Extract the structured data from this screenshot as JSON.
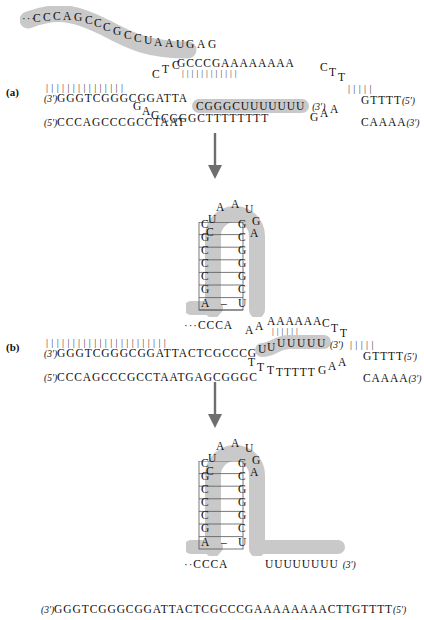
{
  "figure": {
    "type": "molecular-schematic",
    "highlight_color": "#c9c9c9",
    "arrow_color": "#6e6e6e",
    "background": "#ffffff"
  },
  "panels": [
    {
      "id": "a",
      "label": "(a)",
      "free_rna_strand": {
        "leading_ellipsis": "···",
        "sequence": "CCCAGCCCGCCUAAUGAG",
        "highlighted": true
      },
      "duplex": {
        "top_strand_label": "(3')",
        "top_strand": "GGGTCGGGCGGATTA",
        "bottom_strand_label": "(5')",
        "bottom_strand": "CCCAGCCCGCCTAAT",
        "basepair_count": 15
      },
      "top_arc": {
        "step_up": "CTC",
        "paired_top": "GCCCGAAAAAAAA",
        "step_down": "CTT",
        "right_top": "GTTTT",
        "right_top_end": "(5')"
      },
      "bottom_arc": {
        "step_down": "GAG",
        "sequence": "CGGGCTTTTTTTT",
        "step_up": "GAA",
        "right_bottom": "CAAAA",
        "right_bottom_end": "(3')"
      },
      "bound_rna": {
        "sequence": "CGGGCUUUUUUU",
        "end_label": "(3')",
        "highlighted": true
      }
    },
    {
      "id": "b",
      "label": "(b)",
      "hairpin": {
        "loop_left": [
          "U",
          "C"
        ],
        "loop_top": [
          "A",
          "A",
          "U"
        ],
        "loop_right": [
          "G",
          "A"
        ],
        "stem_left": [
          "C",
          "G",
          "C",
          "C",
          "C",
          "G",
          "A"
        ],
        "stem_right": [
          "G",
          "C",
          "G",
          "G",
          "G",
          "C",
          "U"
        ],
        "tail_left_ellipsis": "···",
        "tail_left": "CCCA",
        "highlighted": true
      },
      "duplex": {
        "top_strand_label": "(3')",
        "top_strand": "GGGTCGGGCGGATTACTCGCCCG",
        "bottom_strand_label": "(5')",
        "bottom_strand": "CCCAGCCCGCCTAATGAGCGGGC",
        "basepair_count": 23
      },
      "top_arc": {
        "step_up": "AA",
        "paired_top": "AAAAAA",
        "step_down": "CTT",
        "right_top": "GTTTT",
        "right_top_end": "(5')"
      },
      "bottom_arc": {
        "step_down": "TTT",
        "sequence": "TTTTT",
        "step_up": "GAA",
        "right_bottom": "CAAAA",
        "right_bottom_end": "(3')"
      },
      "bound_rna": {
        "sequence": "UUUUUUU",
        "end_label": "(3')",
        "highlighted": true
      }
    },
    {
      "id": "c",
      "label": "",
      "hairpin": {
        "loop_left": [
          "U",
          "C"
        ],
        "loop_top": [
          "A",
          "A",
          "U"
        ],
        "loop_right": [
          "G",
          "A"
        ],
        "stem_left": [
          "C",
          "G",
          "C",
          "C",
          "C",
          "G",
          "A"
        ],
        "stem_right": [
          "G",
          "C",
          "G",
          "G",
          "G",
          "C",
          "U"
        ],
        "tail_left_ellipsis": "··",
        "tail_left": "CCCA",
        "tail_right": "UUUUUUUU",
        "tail_right_end": "(3')",
        "highlighted": true
      }
    }
  ],
  "bottom_sequence": {
    "five_prime_label": "(3')",
    "sequence": "GGGTCGGGCGGATTACTCGCCCGAAAAAAAACTTGTTTT",
    "three_prime_label": "(5')"
  },
  "arrows": [
    {
      "name": "arrow-a-to-b",
      "direction": "down"
    },
    {
      "name": "arrow-b-to-c",
      "direction": "down"
    }
  ]
}
